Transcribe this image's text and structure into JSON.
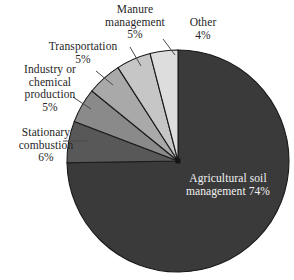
{
  "chart_data": {
    "type": "pie",
    "title": "",
    "subtitle": "",
    "xlabel": "",
    "ylabel": "",
    "legend_position": "none",
    "grid": false,
    "units": "percent",
    "total": 99,
    "categories": [
      "Agricultural soil management",
      "Stationary combustion",
      "Industry or chemical production",
      "Transportation",
      "Manure management",
      "Other"
    ],
    "values": [
      74,
      6,
      5,
      5,
      5,
      4
    ],
    "slices": [
      {
        "name": "agricultural-soil-management",
        "label_line1": "Agricultural soil",
        "label_line2": "management",
        "value": 74,
        "pct_text": "74%",
        "color": "#3a3a3a",
        "label_placement": "inside",
        "label_color": "#f2f2f2"
      },
      {
        "name": "stationary-combustion",
        "label_line1": "Stationary",
        "label_line2": "combustion",
        "value": 6,
        "pct_text": "6%",
        "color": "#585858",
        "label_placement": "outside-left",
        "label_color": "#262626"
      },
      {
        "name": "industry-or-chemical-production",
        "label_line1": "Industry or",
        "label_line2": "chemical",
        "label_line3": "production",
        "value": 5,
        "pct_text": "5%",
        "color": "#8a8a8a",
        "label_placement": "outside-left",
        "label_color": "#262626"
      },
      {
        "name": "transportation",
        "label_line1": "Transportation",
        "value": 5,
        "pct_text": "5%",
        "color": "#a9a9a9",
        "label_placement": "outside-upper-left",
        "label_color": "#262626"
      },
      {
        "name": "manure-management",
        "label_line1": "Manure",
        "label_line2": "management",
        "value": 5,
        "pct_text": "5%",
        "color": "#c6c6c6",
        "label_placement": "outside-top",
        "label_color": "#262626"
      },
      {
        "name": "other",
        "label_line1": "Other",
        "value": 4,
        "pct_text": "4%",
        "color": "#dddddd",
        "label_placement": "outside-top-right",
        "label_color": "#262626"
      }
    ],
    "geometry": {
      "center_x": 178,
      "center_y": 161,
      "radius": 111,
      "start_angle_deg": 0,
      "direction": "clockwise"
    },
    "style": {
      "background": "#ffffff",
      "slice_border": "#1a1a1a",
      "leader_line": "#4a4a4a"
    }
  }
}
